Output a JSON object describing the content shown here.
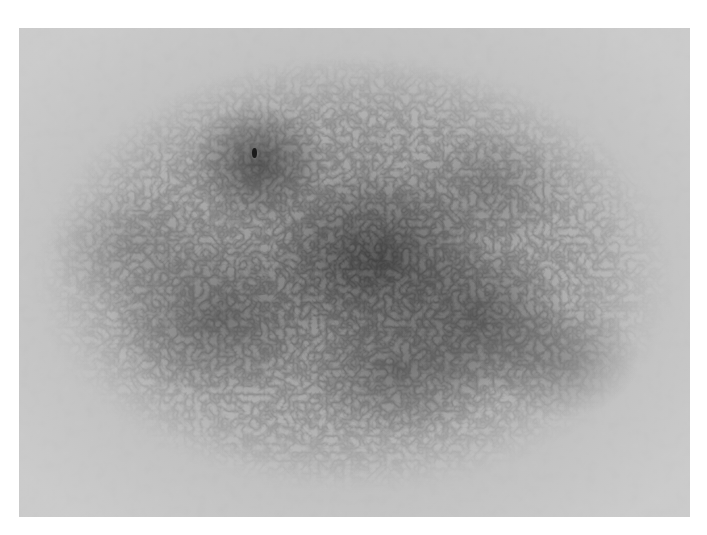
{
  "image": {
    "description": "Grayscale dermoscopy photograph of a pigmented skin lesion with reticular (network) pattern, surrounded by a white border",
    "colors": {
      "border": "#ffffff",
      "background_skin": "#cfcfcf",
      "lesion_dark": "#3c3c3c",
      "speck": "#1a1a1a"
    },
    "photo_region": {
      "left": 19,
      "top": 28,
      "width": 671,
      "height": 489
    }
  }
}
